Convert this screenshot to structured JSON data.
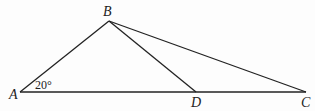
{
  "diagram": {
    "type": "geometry-triangle",
    "points": {
      "A": {
        "label": "A",
        "x": 20,
        "y": 92
      },
      "B": {
        "label": "B",
        "x": 109,
        "y": 21
      },
      "D": {
        "label": "D",
        "x": 196,
        "y": 92
      },
      "C": {
        "label": "C",
        "x": 306,
        "y": 92
      }
    },
    "segments": [
      "AB",
      "BC",
      "BD",
      "AC"
    ],
    "angle_label": {
      "vertex": "A",
      "text": "20°"
    }
  }
}
